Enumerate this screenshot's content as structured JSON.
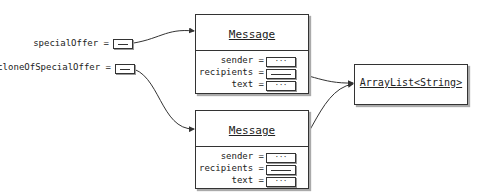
{
  "variables": [
    {
      "name": "specialOffer",
      "label": "specialOffer ="
    },
    {
      "name": "cloneOfSpecialOffer",
      "label": "cloneOfSpecialOffer ="
    }
  ],
  "objects": {
    "message_top": {
      "title": "Message",
      "fields": [
        {
          "label": "sender =",
          "value": "···"
        },
        {
          "label": "recipients =",
          "value": ""
        },
        {
          "label": "text =",
          "value": "···"
        }
      ]
    },
    "message_bottom": {
      "title": "Message",
      "fields": [
        {
          "label": "sender =",
          "value": "···"
        },
        {
          "label": "recipients =",
          "value": ""
        },
        {
          "label": "text =",
          "value": "···"
        }
      ]
    },
    "arraylist": {
      "title": "ArrayList<String>"
    }
  },
  "colors": {
    "line": "#333333",
    "shadow": "#aaaaaa",
    "background": "#ffffff"
  }
}
